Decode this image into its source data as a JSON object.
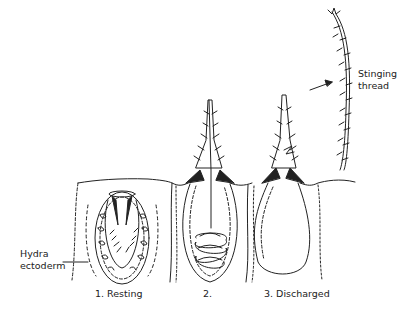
{
  "diagram": {
    "labels": {
      "ectoderm": [
        "Hydra",
        "ectoderm"
      ],
      "stage1": "1. Resting",
      "stage2": "2.",
      "stage3": "3. Discharged",
      "thread": [
        "Stinging",
        "thread"
      ]
    },
    "colors": {
      "ink": "#222222",
      "background": "#ffffff"
    }
  }
}
